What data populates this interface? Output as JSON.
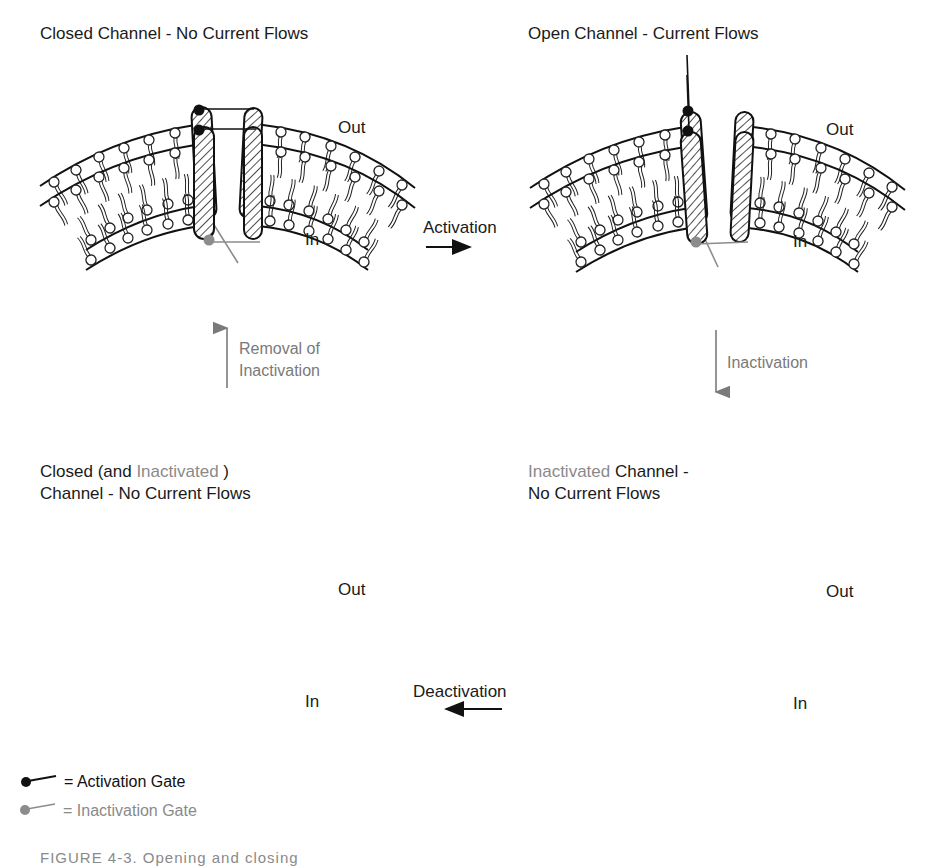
{
  "panels": {
    "top_left": {
      "title": "Closed Channel - No Current Flows",
      "out_label": "Out",
      "in_label": "In",
      "state": "closed"
    },
    "top_right": {
      "title": "Open Channel - Current Flows",
      "out_label": "Out",
      "in_label": "In",
      "state": "open"
    },
    "bottom_left": {
      "title_line1_prefix": "Closed (and ",
      "title_line1_gray": "Inactivated",
      "title_line1_suffix": " )",
      "title_line2": "Channel - No Current Flows",
      "out_label": "Out",
      "in_label": "In",
      "state": "closed-inactivated"
    },
    "bottom_right": {
      "title_line1_gray": "Inactivated",
      "title_line1_suffix": " Channel -",
      "title_line2": "No Current Flows",
      "out_label": "Out",
      "in_label": "In",
      "state": "inactivated"
    }
  },
  "transitions": {
    "activation": "Activation",
    "inactivation": "Inactivation",
    "removal_line1": "Removal of",
    "removal_line2": "Inactivation",
    "deactivation": "Deactivation"
  },
  "legend": {
    "activation_gate": "= Activation Gate",
    "inactivation_gate": "= Inactivation Gate"
  },
  "caption": "FIGURE 4-3.  Opening and closing",
  "colors": {
    "ink": "#1a1a1a",
    "gray": "#8a8a8a",
    "activation_gate": "#111111",
    "inactivation_gate": "#8c8c8c"
  }
}
